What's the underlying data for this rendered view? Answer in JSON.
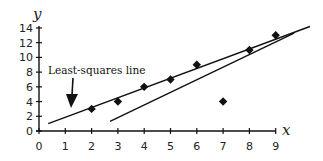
{
  "chart_data": {
    "type": "scatter",
    "title": "",
    "xlabel": "x",
    "ylabel": "y",
    "xlim": [
      0,
      9
    ],
    "ylim": [
      0,
      14
    ],
    "grid": false,
    "legend": null,
    "x_ticks": [
      "0",
      "1",
      "2",
      "3",
      "4",
      "5",
      "6",
      "7",
      "8",
      "9"
    ],
    "y_ticks": [
      "0",
      "2",
      "4",
      "6",
      "8",
      "10",
      "12",
      "14"
    ],
    "series": [
      {
        "name": "data points",
        "marker": "diamond",
        "points": [
          {
            "x": 2,
            "y": 3
          },
          {
            "x": 3,
            "y": 4
          },
          {
            "x": 4,
            "y": 6
          },
          {
            "x": 5,
            "y": 7
          },
          {
            "x": 6,
            "y": 9
          },
          {
            "x": 7,
            "y": 4
          },
          {
            "x": 8,
            "y": 11
          },
          {
            "x": 9,
            "y": 13
          }
        ]
      }
    ],
    "lines": [
      {
        "name": "Least-squares line",
        "from": {
          "x": 0.35,
          "y": 1.0
        },
        "to": {
          "x": 10.3,
          "y": 14.2
        }
      },
      {
        "name": "second line",
        "from": {
          "x": 2.7,
          "y": 1.3
        },
        "to": {
          "x": 9.7,
          "y": 13.3
        }
      }
    ],
    "annotations": [
      {
        "text": "Least-squares line",
        "arrow_to": {
          "x": 1.2,
          "y": 2.5
        }
      }
    ]
  },
  "labels": {
    "x_axis": "x",
    "y_axis": "y",
    "annotation": "Least-squares line"
  }
}
